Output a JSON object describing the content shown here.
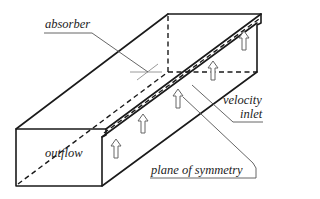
{
  "diagram": {
    "type": "3d-channel-schematic",
    "colors": {
      "edge": "#1a1a1a",
      "leader": "#555555",
      "absorber": "#9a9a9a",
      "arrow": "#666666",
      "background": "#ffffff"
    },
    "labels": {
      "absorber": "absorber",
      "velocity": "velocity",
      "inlet": "inlet",
      "outflow": "outflow",
      "plane_of_symmetry": "plane of symmetry"
    },
    "inlet_arrow_count": 5
  }
}
